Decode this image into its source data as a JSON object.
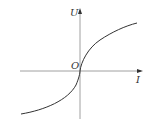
{
  "diagram": {
    "title": "",
    "axes": {
      "y_label": "U",
      "x_label": "I",
      "origin_label": "O"
    },
    "curve": {
      "description": "S-shaped curve passing through origin, concave down for I>0 and concave up for I<0",
      "color": "#333333"
    },
    "axis_color": "#888888"
  }
}
